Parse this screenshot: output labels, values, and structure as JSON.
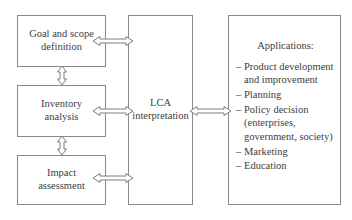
{
  "diagram": {
    "line_color": "#8a8a8a",
    "text_color": "#3d3d3d",
    "background_color": "#ffffff"
  },
  "stages": [
    {
      "id": "goal-scope",
      "label": "Goal and scope definition",
      "line1": "Goal and scope",
      "line2": "definition"
    },
    {
      "id": "inventory",
      "label": "Inventory analysis",
      "line1": "Inventory",
      "line2": "analysis"
    },
    {
      "id": "impact",
      "label": "Impact assessment",
      "line1": "Impact",
      "line2": "assessment"
    }
  ],
  "interpretation": {
    "label": "LCA interpretation",
    "line1": "LCA",
    "line2": "interpretation"
  },
  "applications": {
    "title": "Applications:",
    "bullet_marker": "–",
    "items": [
      {
        "line1": "Product development",
        "line2": "and improvement"
      },
      {
        "line1": "Planning",
        "line2": ""
      },
      {
        "line1": "Policy decision",
        "line2": "(enterprises,",
        "line3": "government, society)"
      },
      {
        "line1": "Marketing",
        "line2": ""
      },
      {
        "line1": "Education",
        "line2": ""
      }
    ]
  },
  "connectors": [
    {
      "id": "goal-to-lca",
      "orientation": "horizontal",
      "type": "double-headed"
    },
    {
      "id": "inventory-to-lca",
      "orientation": "horizontal",
      "type": "double-headed"
    },
    {
      "id": "impact-to-lca",
      "orientation": "horizontal",
      "type": "double-headed"
    },
    {
      "id": "goal-inventory",
      "orientation": "vertical",
      "type": "double-headed"
    },
    {
      "id": "inventory-impact",
      "orientation": "vertical",
      "type": "double-headed"
    },
    {
      "id": "lca-to-applications",
      "orientation": "horizontal",
      "type": "double-headed"
    }
  ]
}
